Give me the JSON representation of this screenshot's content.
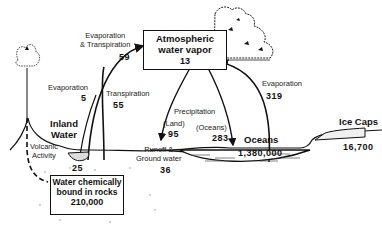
{
  "diagram": {
    "reservoirs": {
      "atmosphere": {
        "line1": "Atmospheric",
        "line2": "water vapor",
        "value": "13"
      },
      "inland_water": {
        "line1": "Inland",
        "line2": "Water",
        "value": "25"
      },
      "oceans": {
        "label": "Oceans",
        "value": "1,380,000"
      },
      "ice_caps": {
        "label": "Ice Caps",
        "value": "16,700"
      },
      "rocks": {
        "line1": "Water chemically",
        "line2": "bound in rocks",
        "value": "210,000"
      }
    },
    "fluxes": {
      "evap_transp": {
        "line1": "Evaporation",
        "line2": "& Transpiration",
        "value": "59"
      },
      "evaporation_land": {
        "label": "Evaporation",
        "value": "5"
      },
      "transpiration": {
        "label": "Transpiration",
        "value": "55"
      },
      "precipitation": {
        "label": "Precipitation",
        "land_label": "(Land)",
        "land_value": "95",
        "ocean_label": "(Oceans)",
        "ocean_value": "283"
      },
      "evaporation_ocean": {
        "label": "Evaporation",
        "value": "319"
      },
      "runoff": {
        "line1": "Runoff &",
        "line2": "Ground water",
        "value": "36"
      },
      "volcanic": {
        "line1": "Volcanic",
        "line2": "Activity"
      }
    }
  }
}
